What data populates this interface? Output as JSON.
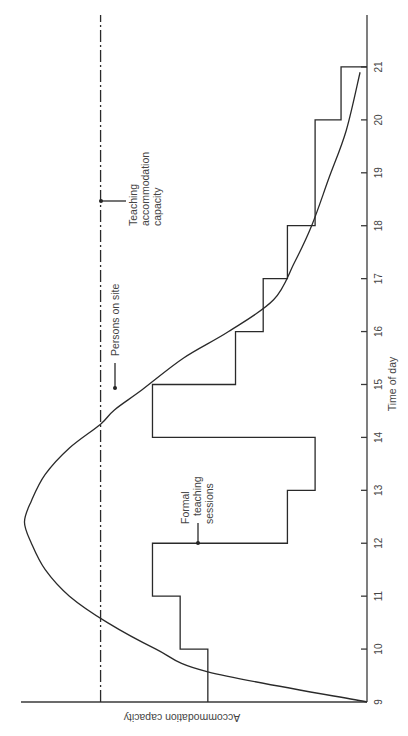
{
  "chart_data": {
    "type": "line",
    "orientation_note": "figure rotated 90deg counter-clockwise",
    "title": "",
    "xlabel": "Time of day",
    "ylabel": "Accommodation capacity",
    "x_ticks": [
      9,
      10,
      11,
      12,
      13,
      14,
      15,
      16,
      17,
      18,
      19,
      20,
      21
    ],
    "xlim": [
      9,
      21.9
    ],
    "ylim": [
      0,
      100
    ],
    "grid": false,
    "series": [
      {
        "name": "Teaching accommodation capacity",
        "style": "dash-dot",
        "kind": "constant",
        "value": 77
      },
      {
        "name": "Persons on site",
        "style": "solid-curve",
        "points": [
          [
            9.0,
            0
          ],
          [
            9.57,
            46
          ],
          [
            10.0,
            61
          ],
          [
            10.5,
            75
          ],
          [
            11.0,
            86
          ],
          [
            11.5,
            93
          ],
          [
            12.0,
            97
          ],
          [
            12.4,
            99
          ],
          [
            12.8,
            97
          ],
          [
            13.3,
            93
          ],
          [
            13.8,
            86
          ],
          [
            14.25,
            77
          ],
          [
            14.52,
            73
          ],
          [
            14.9,
            65
          ],
          [
            15.5,
            53
          ],
          [
            16.0,
            40
          ],
          [
            16.6,
            27
          ],
          [
            17.3,
            21
          ],
          [
            18.0,
            16
          ],
          [
            18.9,
            11
          ],
          [
            19.8,
            6
          ],
          [
            20.9,
            2
          ]
        ]
      },
      {
        "name": "Formal teaching sessions",
        "style": "step",
        "steps": [
          {
            "from": 9,
            "to": 10,
            "value": 46
          },
          {
            "from": 10,
            "to": 11,
            "value": 54
          },
          {
            "from": 11,
            "to": 12,
            "value": 62
          },
          {
            "from": 12,
            "to": 13,
            "value": 23
          },
          {
            "from": 13,
            "to": 14,
            "value": 15
          },
          {
            "from": 14,
            "to": 15,
            "value": 62
          },
          {
            "from": 15,
            "to": 16,
            "value": 38
          },
          {
            "from": 16,
            "to": 17,
            "value": 30
          },
          {
            "from": 17,
            "to": 18,
            "value": 23
          },
          {
            "from": 18,
            "to": 20,
            "value": 15
          },
          {
            "from": 20,
            "to": 21,
            "value": 7.5
          }
        ]
      }
    ],
    "annotations": [
      {
        "text": [
          "Teaching",
          "accommodation",
          "capacity"
        ],
        "target": "Teaching accommodation capacity",
        "at_time": 18.5
      },
      {
        "text": [
          "Persons on site"
        ],
        "target": "Persons on site",
        "at_time": 14.9
      },
      {
        "text": [
          "Formal",
          "teaching",
          "sessions"
        ],
        "target": "Formal teaching sessions",
        "at_time": 12.0
      }
    ]
  },
  "labels": {
    "xlabel": "Time of day",
    "ylabel": "Accommodation capacity",
    "anno_capacity": [
      "Teaching",
      "accommodation",
      "capacity"
    ],
    "anno_persons": "Persons on site",
    "anno_sessions": [
      "Formal",
      "teaching",
      "sessions"
    ],
    "ticks": [
      "9",
      "10",
      "11",
      "12",
      "13",
      "14",
      "15",
      "16",
      "17",
      "18",
      "19",
      "20",
      "21"
    ]
  }
}
